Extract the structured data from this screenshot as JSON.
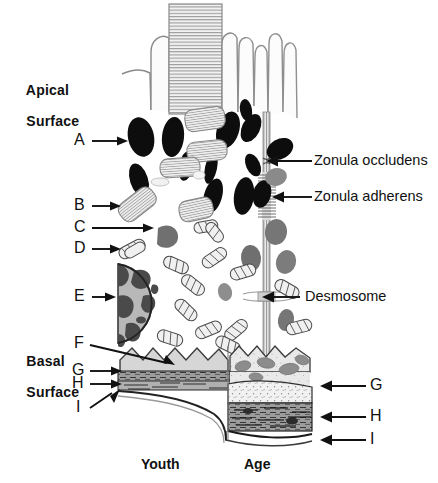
{
  "figure": {
    "width": 438,
    "height": 483
  },
  "surface_labels": {
    "apical_line1": "Apical",
    "apical_line2": "Surface",
    "basal_line1": "Basal",
    "basal_line2": "Surface"
  },
  "letter_labels": [
    {
      "id": "A",
      "text": "A"
    },
    {
      "id": "B",
      "text": "B"
    },
    {
      "id": "C",
      "text": "C"
    },
    {
      "id": "D",
      "text": "D"
    },
    {
      "id": "E",
      "text": "E"
    },
    {
      "id": "F",
      "text": "F"
    },
    {
      "id": "G",
      "text": "G"
    },
    {
      "id": "H",
      "text": "H"
    },
    {
      "id": "I",
      "text": "I"
    }
  ],
  "right_letter_labels": [
    {
      "id": "G",
      "text": "G"
    },
    {
      "id": "H",
      "text": "H"
    },
    {
      "id": "I",
      "text": "I"
    }
  ],
  "term_labels": {
    "zonula_occludens": "Zonula occludens",
    "zonula_adherens": "Zonula adherens",
    "desmosome": "Desmosome"
  },
  "footer_labels": {
    "youth": "Youth",
    "age": "Age"
  },
  "colors": {
    "background": "#ffffff",
    "ink": "#111111",
    "dark_organelle": "#0d0d0d",
    "mid_gray": "#707070",
    "light_gray": "#c9c9c9",
    "pale_gray": "#e6e6e6",
    "outline": "#555555",
    "nucleus_fill": "#b3b3b3",
    "nucleus_dark": "#4a4a4a",
    "band_dark": "#8f8f8f",
    "band_light": "#efefef"
  }
}
